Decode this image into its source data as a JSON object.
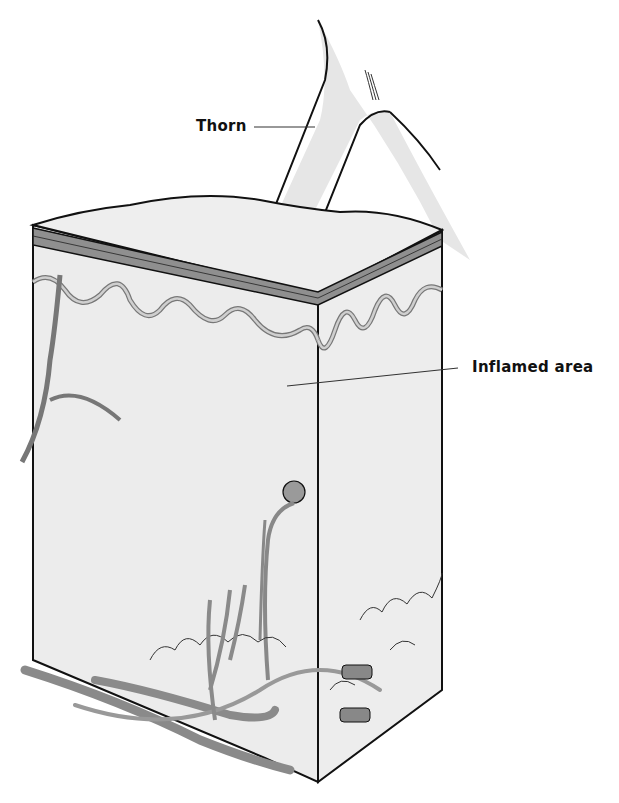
{
  "figure": {
    "colors": {
      "background": "#ffffff",
      "tissue": "#ececec",
      "thorn": "#e6e6e6",
      "vessel": "#9a9a9a",
      "outline": "#111111"
    }
  },
  "labels": [
    {
      "text": "Thorn"
    },
    {
      "text": "Inflamed area"
    }
  ]
}
